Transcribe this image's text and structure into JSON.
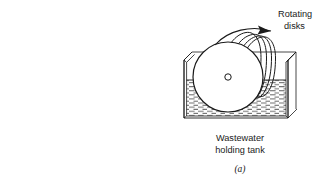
{
  "figure": {
    "name": "rotating-biological-contactor-diagram",
    "caption": "(a)",
    "background_color": "#ffffff",
    "line_color": "#1a1a1a"
  },
  "labels": {
    "rotating_disks_line1": "Rotating",
    "rotating_disks_line2": "disks",
    "tank_line1": "Wastewater",
    "tank_line2": "holding tank"
  },
  "annotations": {
    "rotation_arrow": "rotation-direction-arrow"
  },
  "components": {
    "disk_stack_label": "rotating-disk-stack",
    "front_disk_label": "front-disk",
    "shaft_hub_label": "shaft-hub",
    "tank_label": "wastewater-holding-tank",
    "water_label": "wastewater-fill",
    "water_surface_label": "water-surface-line"
  },
  "geometry": {
    "front_disk_center_x": 228,
    "front_disk_center_y": 77,
    "front_disk_radius": 35,
    "hub_radius": 3.2,
    "water_level_y": 80,
    "tank_left_x": 184,
    "tank_right_x": 288,
    "tank_bottom_y": 118,
    "tank_top_y": 58,
    "disk_count": 5
  }
}
